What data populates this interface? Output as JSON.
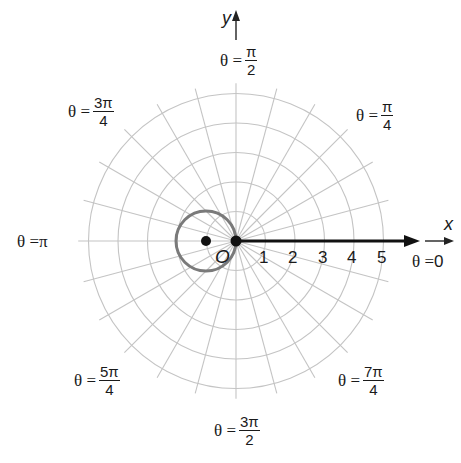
{
  "figure": {
    "type": "polar-coordinate-diagram",
    "origin_label": "O",
    "x_axis_label": "x",
    "y_axis_label": "y",
    "radial_ticks": [
      "1",
      "2",
      "3",
      "4",
      "5"
    ],
    "angle_labels": {
      "a0": {
        "prefix": "θ = ",
        "value": "0"
      },
      "a45": {
        "prefix": "θ = ",
        "num": "π",
        "den": "4"
      },
      "a90": {
        "prefix": "θ = ",
        "num": "π",
        "den": "2"
      },
      "a135": {
        "prefix": "θ = ",
        "num": "3π",
        "den": "4"
      },
      "a180": {
        "prefix": "θ = ",
        "value": "π"
      },
      "a225": {
        "prefix": "θ = ",
        "num": "5π",
        "den": "4"
      },
      "a270": {
        "prefix": "θ = ",
        "num": "3π",
        "den": "2"
      },
      "a315": {
        "prefix": "θ = ",
        "num": "7π",
        "den": "4"
      }
    },
    "grid": {
      "rings": [
        1,
        2,
        3,
        4,
        5
      ],
      "radial_line_step_deg": 15,
      "color": "#c4c4c4"
    },
    "curve": {
      "description": "circle through origin, center at (-1, 0), radius 1 (r = -2cosθ)",
      "color": "#7a7a7a"
    },
    "points": [
      {
        "name": "origin",
        "x": 0,
        "y": 0
      },
      {
        "name": "center",
        "x": -1,
        "y": 0
      }
    ],
    "polar_axis": {
      "from": 0,
      "to": 5.8,
      "color": "#111111"
    }
  }
}
